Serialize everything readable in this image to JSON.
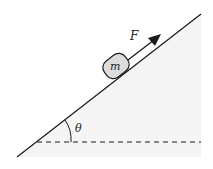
{
  "diagram": {
    "title": "",
    "type": "inclined-plane-force-diagram",
    "labels": {
      "force": "F",
      "mass": "m",
      "angle": "θ"
    },
    "colors": {
      "background": "#ffffff",
      "incline_fill": "#f4f4f4",
      "line": "#1a1a1a",
      "block_fill": "#dcdcdc"
    },
    "elements": [
      {
        "id": "incline",
        "kind": "line",
        "description": "Inclined plane surface"
      },
      {
        "id": "horizontal-reference",
        "kind": "dashed-line",
        "description": "Horizontal reference line"
      },
      {
        "id": "block",
        "kind": "rounded-rect",
        "label": "m",
        "description": "Mass on incline"
      },
      {
        "id": "force-arrow",
        "kind": "arrow",
        "label": "F",
        "description": "Applied force parallel to incline, pointing up the slope"
      },
      {
        "id": "angle-arc",
        "kind": "arc",
        "label": "θ",
        "description": "Incline angle between incline and horizontal"
      }
    ]
  }
}
